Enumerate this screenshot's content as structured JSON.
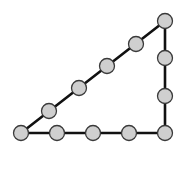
{
  "diagram": {
    "title": "",
    "colors": {
      "background": "#ffffff",
      "edge": "#111111",
      "node_fill": "#cfcfcf",
      "node_stroke": "#3a3a3a"
    },
    "node_radius": 7.5,
    "edge_width": 2.6,
    "vertices": {
      "bottom_left": [
        21,
        133
      ],
      "bottom_right": [
        165,
        133
      ],
      "top_right": [
        165,
        21
      ]
    },
    "edges": [
      {
        "name": "base-edge",
        "from": [
          21,
          133
        ],
        "to": [
          165,
          133
        ]
      },
      {
        "name": "vertical-edge",
        "from": [
          165,
          133
        ],
        "to": [
          165,
          21
        ]
      },
      {
        "name": "hypotenuse-edge",
        "from": [
          21,
          133
        ],
        "to": [
          165,
          21
        ]
      }
    ],
    "nodes": [
      {
        "name": "node-bottom-left-corner",
        "x": 21,
        "y": 133
      },
      {
        "name": "node-base-1",
        "x": 57,
        "y": 133
      },
      {
        "name": "node-base-2",
        "x": 93,
        "y": 133
      },
      {
        "name": "node-base-3",
        "x": 129,
        "y": 133
      },
      {
        "name": "node-bottom-right-corner",
        "x": 165,
        "y": 133
      },
      {
        "name": "node-vertical-1",
        "x": 165,
        "y": 96
      },
      {
        "name": "node-vertical-2",
        "x": 165,
        "y": 58
      },
      {
        "name": "node-top-right-corner",
        "x": 165,
        "y": 21
      },
      {
        "name": "node-hypotenuse-1",
        "x": 49,
        "y": 111
      },
      {
        "name": "node-hypotenuse-2",
        "x": 79,
        "y": 88
      },
      {
        "name": "node-hypotenuse-3",
        "x": 107,
        "y": 66
      },
      {
        "name": "node-hypotenuse-4",
        "x": 136,
        "y": 44
      }
    ],
    "node_counts": {
      "base_side": 5,
      "vertical_side": 4,
      "hypotenuse_side": 6,
      "total_unique": 12
    }
  }
}
